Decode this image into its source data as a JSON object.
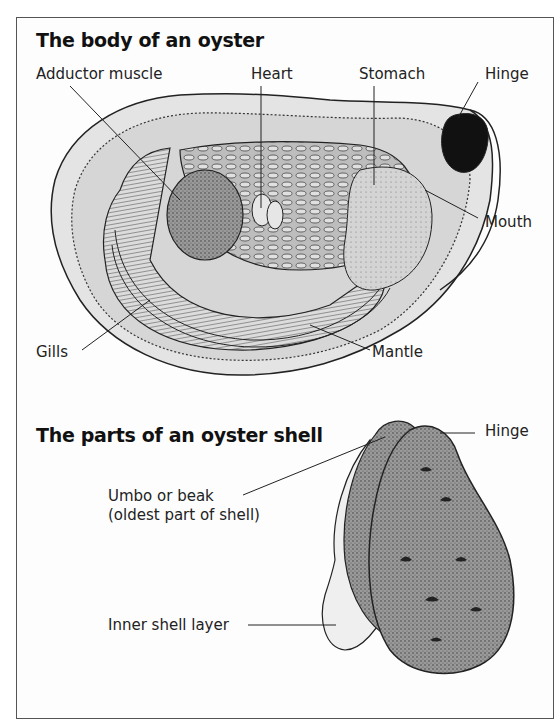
{
  "figure": {
    "sections": [
      {
        "title": "The body of an oyster",
        "labels": {
          "adductor_muscle": "Adductor muscle",
          "heart": "Heart",
          "stomach": "Stomach",
          "hinge": "Hinge",
          "mouth": "Mouth",
          "gills": "Gills",
          "mantle": "Mantle"
        }
      },
      {
        "title": "The parts of an oyster shell",
        "labels": {
          "hinge": "Hinge",
          "umbo_line1": "Umbo or beak",
          "umbo_line2": "(oldest part of shell)",
          "inner_shell_layer": "Inner shell layer"
        }
      }
    ]
  }
}
